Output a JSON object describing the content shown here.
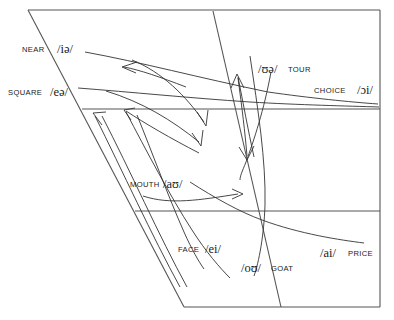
{
  "diagram": {
    "type": "vowel-quadrilateral",
    "background_color": "#ffffff",
    "line_color": "#555555",
    "curve_color": "#333333",
    "text_color": "#1a1a1a"
  },
  "labels": {
    "near": {
      "word": "NEAR",
      "ipa": "/iə/"
    },
    "square": {
      "word": "SQUARE",
      "ipa": "/eə/"
    },
    "tour": {
      "word": "TOUR",
      "ipa": "/ʊə/"
    },
    "choice": {
      "word": "CHOICE",
      "ipa": "/ɔi/"
    },
    "mouth": {
      "word": "MOUTH",
      "ipa": "/aʊ/"
    },
    "face": {
      "word": "FACE",
      "ipa": "/ei/"
    },
    "goat": {
      "word": "GOAT",
      "ipa": "/oʊ/"
    },
    "price": {
      "word": "PRICE",
      "ipa": "/ai/"
    }
  }
}
